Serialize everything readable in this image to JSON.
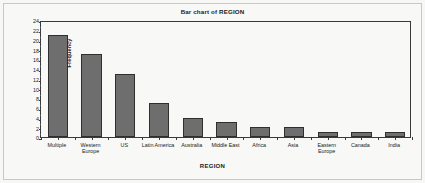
{
  "figure": {
    "background_color": "#f8f8f6",
    "frame_color": "#c8c8c4",
    "axis_color": "#3a3a3a",
    "bar_fill_color": "#6e6e6e",
    "bar_edge_color": "#2f2f2f"
  },
  "chart_data": {
    "type": "bar",
    "title": "Bar chart of REGION",
    "xlabel": "REGION",
    "ylabel": "Frequency",
    "categories": [
      "Multiple",
      "Western Europe",
      "US",
      "Latin America",
      "Australia",
      "Middle East",
      "Africa",
      "Asia",
      "Eastern Europe",
      "Canada",
      "India"
    ],
    "values": [
      21,
      17,
      13,
      7,
      4,
      3,
      2,
      2,
      1,
      1,
      1
    ],
    "ylim": [
      0,
      24
    ],
    "ytick_labels": [
      "24",
      "22",
      "20",
      "18",
      "16",
      "14",
      "12",
      "10",
      "8",
      "6",
      "4",
      "2",
      "0"
    ],
    "ytick_values": [
      24,
      22,
      20,
      18,
      16,
      14,
      12,
      10,
      8,
      6,
      4,
      2,
      0
    ],
    "ytick_step": 2,
    "grid": false,
    "legend": false
  }
}
